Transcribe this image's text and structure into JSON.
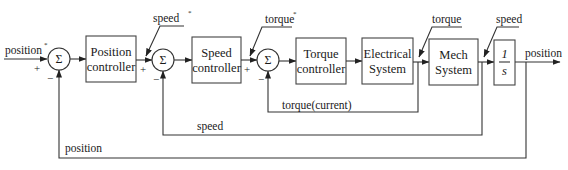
{
  "diagram": {
    "type": "control-loop block diagram",
    "inputs": {
      "position_ref": "position",
      "position_ref_mark": "*",
      "speed_ref": "speed",
      "speed_ref_mark": "*",
      "torque_ref": "torque",
      "torque_ref_mark": "*"
    },
    "summing_junctions": [
      {
        "id": "sum1",
        "symbol": "Σ",
        "plus": "+",
        "minus": "−"
      },
      {
        "id": "sum2",
        "symbol": "Σ",
        "plus": "+",
        "minus": "−"
      },
      {
        "id": "sum3",
        "symbol": "Σ",
        "plus": "+",
        "minus": "−"
      }
    ],
    "blocks": [
      {
        "id": "position-controller",
        "line1": "Position",
        "line2": "controller"
      },
      {
        "id": "speed-controller",
        "line1": "Speed",
        "line2": "controller"
      },
      {
        "id": "torque-controller",
        "line1": "Torque",
        "line2": "controller"
      },
      {
        "id": "electrical-system",
        "line1": "Electrical",
        "line2": "System"
      },
      {
        "id": "mech-system",
        "line1": "Mech",
        "line2": "System"
      },
      {
        "id": "integrator",
        "numerator": "1",
        "denominator": "s"
      }
    ],
    "signals": {
      "torque_out": "torque",
      "speed_out": "speed",
      "position_out": "position"
    },
    "feedback": [
      {
        "id": "torque-feedback",
        "label": "torque(current)"
      },
      {
        "id": "speed-feedback",
        "label": "speed"
      },
      {
        "id": "position-feedback",
        "label": "position"
      }
    ]
  }
}
